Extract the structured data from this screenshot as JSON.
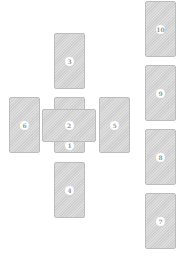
{
  "spread": {
    "name": "Celtic Cross",
    "card_color": "#d6d6d6",
    "border_color": "#bdbdbd",
    "label_bg": "#ffffff",
    "label_color": "#9a9a9a",
    "cards": [
      {
        "position": "1",
        "label": "1",
        "orientation": "vertical"
      },
      {
        "position": "2",
        "label": "2",
        "orientation": "horizontal"
      },
      {
        "position": "3",
        "label": "3",
        "orientation": "vertical"
      },
      {
        "position": "4",
        "label": "4",
        "orientation": "vertical"
      },
      {
        "position": "5",
        "label": "5",
        "orientation": "vertical"
      },
      {
        "position": "6",
        "label": "6",
        "orientation": "vertical"
      },
      {
        "position": "7",
        "label": "7",
        "orientation": "vertical"
      },
      {
        "position": "8",
        "label": "8",
        "orientation": "vertical"
      },
      {
        "position": "9",
        "label": "9",
        "orientation": "vertical"
      },
      {
        "position": "10",
        "label": "10",
        "orientation": "vertical"
      }
    ]
  }
}
